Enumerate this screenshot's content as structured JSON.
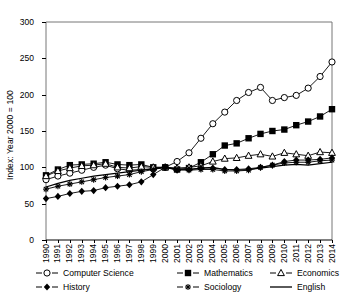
{
  "chart_data": {
    "type": "line",
    "title": "",
    "xlabel": "",
    "ylabel": "Index: Year 2000 = 100",
    "xlim": [
      1990,
      2014
    ],
    "ylim": [
      0,
      300
    ],
    "yticks": [
      0,
      50,
      100,
      150,
      200,
      250,
      300
    ],
    "grid": false,
    "legend_position": "below-plot",
    "x": [
      1990,
      1991,
      1992,
      1993,
      1994,
      1995,
      1996,
      1997,
      1998,
      1999,
      2000,
      2001,
      2002,
      2003,
      2004,
      2005,
      2006,
      2007,
      2008,
      2009,
      2010,
      2011,
      2012,
      2013,
      2014
    ],
    "categories": [
      "1990",
      "1991",
      "1992",
      "1993",
      "1994",
      "1995",
      "1996",
      "1997",
      "1998",
      "1999",
      "2000",
      "2001",
      "2002",
      "2003",
      "2004",
      "2005",
      "2006",
      "2007",
      "2008",
      "2009",
      "2010",
      "2011",
      "2012",
      "2013",
      "2014"
    ],
    "series": [
      {
        "name": "Computer Science",
        "marker": "open-circle",
        "values": [
          83,
          88,
          92,
          96,
          100,
          103,
          98,
          96,
          97,
          98,
          100,
          108,
          120,
          140,
          160,
          176,
          192,
          203,
          210,
          192,
          196,
          199,
          209,
          225,
          245
        ]
      },
      {
        "name": "Mathematics",
        "marker": "filled-square",
        "values": [
          89,
          97,
          103,
          104,
          105,
          107,
          104,
          103,
          104,
          100,
          100,
          97,
          99,
          107,
          118,
          130,
          133,
          140,
          146,
          150,
          152,
          158,
          163,
          170,
          180
        ]
      },
      {
        "name": "Economics",
        "marker": "open-triangle",
        "values": [
          88,
          95,
          99,
          102,
          103,
          105,
          100,
          99,
          101,
          100,
          100,
          99,
          100,
          102,
          108,
          112,
          113,
          116,
          118,
          115,
          120,
          118,
          116,
          121,
          120
        ]
      },
      {
        "name": "History",
        "marker": "filled-diamond",
        "values": [
          57,
          60,
          64,
          67,
          68,
          72,
          74,
          76,
          80,
          90,
          100,
          96,
          97,
          99,
          99,
          97,
          97,
          98,
          100,
          103,
          108,
          110,
          110,
          111,
          113
        ]
      },
      {
        "name": "Sociology",
        "marker": "asterisk",
        "values": [
          70,
          74,
          77,
          80,
          83,
          86,
          88,
          90,
          94,
          97,
          100,
          97,
          96,
          97,
          97,
          95,
          95,
          96,
          100,
          103,
          106,
          107,
          107,
          109,
          110
        ]
      },
      {
        "name": "English",
        "marker": "none",
        "values": [
          73,
          78,
          82,
          85,
          88,
          90,
          92,
          94,
          96,
          98,
          100,
          98,
          97,
          99,
          100,
          97,
          96,
          97,
          99,
          101,
          103,
          104,
          103,
          105,
          107
        ]
      }
    ]
  }
}
